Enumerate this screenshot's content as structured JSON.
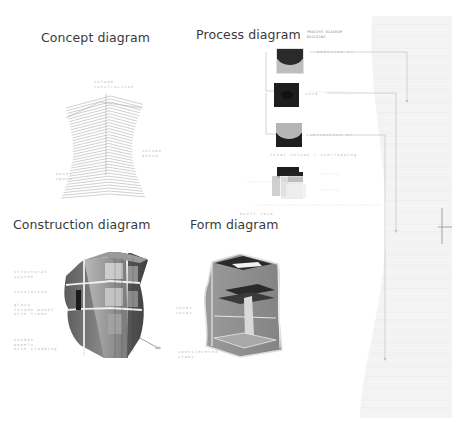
{
  "sheet": {
    "background": "#ffffff",
    "panel_color": "#f4f4f4",
    "line_color": "#c8c8c8",
    "title_color": "#3a3a3a"
  },
  "concept": {
    "title": "Concept diagram",
    "labels": [
      "volume\nconstruction",
      "volume\ndense",
      "outer\nspace"
    ]
  },
  "process": {
    "title": "Process diagram",
    "subtitle": "PROCESS DIAGRAM\nBUILDING",
    "steps": [
      {
        "label": "addition of",
        "fill_top": "#2a2a2a",
        "fill_bottom": "#bdbdbd"
      },
      {
        "label": "void",
        "fill_top": "#1e1e1e",
        "fill_bottom": "#1e1e1e"
      },
      {
        "label": "subtraction of",
        "fill_top": "#b5b5b5",
        "fill_bottom": "#1e1e1e"
      },
      {
        "label": "overlap",
        "fill_top": "#1e1e1e",
        "fill_bottom": "#cfcfcf"
      }
    ],
    "bottom_label": "final volume / overlapping",
    "footer_label": "built form"
  },
  "construction": {
    "title": "Construction diagram",
    "labels": [
      "structural\nsystem",
      "insulation",
      "glass\nfacade panel\nwith frame",
      "wooden\npanels\nwith cladding"
    ]
  },
  "form": {
    "title": "Form diagram",
    "labels": [
      "inner\nvoids",
      "cantilevered\nslabs"
    ]
  },
  "marker": {
    "name": "crosshair"
  }
}
